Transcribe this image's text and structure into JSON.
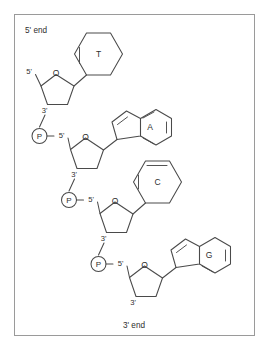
{
  "figure": {
    "title_5_end": "5' end",
    "title_3_end": "3' end",
    "border_color": "#9a9a9a",
    "stroke_color": "#4a4a4a",
    "text_color": "#2e2e2e",
    "background": "#ffffff"
  },
  "labels": {
    "oxygen": "O",
    "five_prime": "5'",
    "three_prime": "3'",
    "phosphate": "P"
  },
  "nucleotides": [
    {
      "base_label": "T",
      "base_name": "thymine",
      "base_ring_type": "pyrimidine",
      "sugar_oxygen": "O",
      "sugar_five_prime": "5'",
      "sugar_three_prime": "3'",
      "has_phosphate": false
    },
    {
      "base_label": "A",
      "base_name": "adenine",
      "base_ring_type": "purine",
      "sugar_oxygen": "O",
      "sugar_five_prime": "5'",
      "sugar_three_prime": "3'",
      "has_phosphate": true,
      "phosphate_label": "P"
    },
    {
      "base_label": "C",
      "base_name": "cytosine",
      "base_ring_type": "pyrimidine",
      "sugar_oxygen": "O",
      "sugar_five_prime": "5'",
      "sugar_three_prime": "3'",
      "has_phosphate": true,
      "phosphate_label": "P"
    },
    {
      "base_label": "G",
      "base_name": "guanine",
      "base_ring_type": "purine",
      "sugar_oxygen": "O",
      "sugar_five_prime": "5'",
      "sugar_three_prime": "3'",
      "has_phosphate": true,
      "phosphate_label": "P"
    }
  ],
  "sequence": "T-A-C-G"
}
